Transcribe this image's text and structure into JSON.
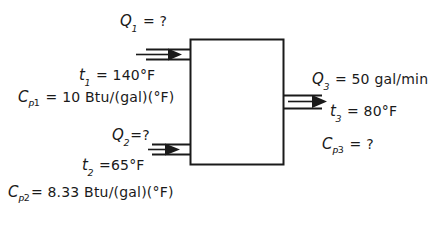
{
  "diagram": {
    "background_color": "#ffffff",
    "line_color": "#1a1a1a",
    "vessel": {
      "name": "mixing-vessel",
      "x": 190,
      "y": 39,
      "width": 94,
      "height": 126
    },
    "streams": [
      {
        "id": "stream-1",
        "role": "inlet",
        "position": "top-left",
        "flow_label": "Q",
        "flow_subscript": "1",
        "flow_value": "?",
        "temp_label": "t",
        "temp_subscript": "1",
        "temp_value": "140°F",
        "cp_label": "C",
        "cp_p": "P",
        "cp_subscript": "1",
        "cp_value": "10 Btu/(gal)(°F)"
      },
      {
        "id": "stream-2",
        "role": "inlet",
        "position": "bottom-left",
        "flow_label": "Q",
        "flow_subscript": "2",
        "flow_value": "?",
        "temp_label": "t",
        "temp_subscript": "2",
        "temp_value": "65°F",
        "cp_label": "C",
        "cp_p": "P",
        "cp_subscript": "2",
        "cp_value": "8.33 Btu/(gal)(°F)"
      },
      {
        "id": "stream-3",
        "role": "outlet",
        "position": "right",
        "flow_label": "Q",
        "flow_subscript": "3",
        "flow_value": "50 gal/min",
        "temp_label": "t",
        "temp_subscript": "3",
        "temp_value": "80°F",
        "cp_label": "C",
        "cp_p": "P",
        "cp_subscript": "3",
        "cp_value": "?"
      }
    ],
    "equals_sign": "=",
    "labels": {
      "q1_text": "Q",
      "q1_sub": "1",
      "q1_val": "?",
      "t1_text": "t",
      "t1_sub": "1",
      "t1_val": "140°F",
      "cp1_c": "C",
      "cp1_p": "P",
      "cp1_sub": "1",
      "cp1_val": "10 Btu/(gal)(°F)",
      "q2_text": "Q",
      "q2_sub": "2",
      "q2_val": "?",
      "t2_text": "t",
      "t2_sub": "2",
      "t2_val": "65°F",
      "cp2_c": "C",
      "cp2_p": "P",
      "cp2_sub": "2",
      "cp2_val": "8.33 Btu/(gal)(°F)",
      "q3_text": "Q",
      "q3_sub": "3",
      "q3_val": "50 gal/min",
      "t3_text": "t",
      "t3_sub": "3",
      "t3_val": "80°F",
      "cp3_c": "C",
      "cp3_p": "P",
      "cp3_sub": "3",
      "cp3_val": "?"
    }
  }
}
